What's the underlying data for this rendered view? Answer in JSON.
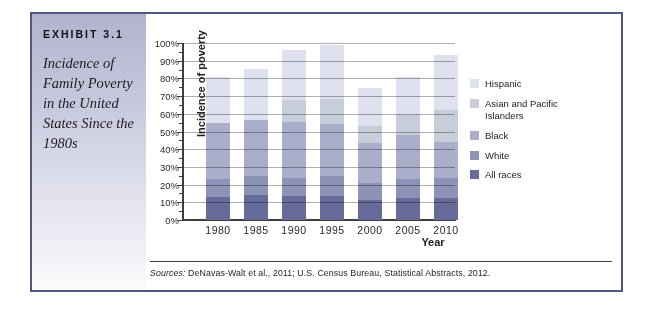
{
  "exhibit": {
    "label": "EXHIBIT 3.1",
    "title": "Incidence of Family Poverty in the United States Since the 1980s"
  },
  "chart_data": {
    "type": "bar",
    "stacked": true,
    "xlabel": "Year",
    "ylabel": "Incidence of poverty",
    "ylim": [
      0,
      100
    ],
    "ytick_step": 10,
    "ytick_minor_step": 5,
    "ytick_suffix": "%",
    "grid": true,
    "legend_position": "right",
    "legend_order": "top-of-stack-first",
    "categories": [
      "1980",
      "1985",
      "1990",
      "1995",
      "2000",
      "2005",
      "2010"
    ],
    "series": [
      {
        "name": "All races",
        "color": "#666b99",
        "values": [
          13.0,
          14.0,
          13.5,
          13.8,
          11.3,
          12.6,
          12.5
        ]
      },
      {
        "name": "White",
        "color": "#8d92b7",
        "values": [
          10.0,
          11.0,
          10.5,
          11.2,
          9.5,
          10.6,
          11.5
        ]
      },
      {
        "name": "Black",
        "color": "#aaaeca",
        "values": [
          32.0,
          31.5,
          31.5,
          29.0,
          22.5,
          24.9,
          20.0
        ]
      },
      {
        "name": "Asian and Pacific Islanders",
        "color": "#c8ced9",
        "values": [
          0,
          0,
          12.5,
          14.5,
          10.0,
          11.1,
          18.0
        ]
      },
      {
        "name": "Hispanic",
        "color": "#dfe2ee",
        "values": [
          26.0,
          29.0,
          28.0,
          30.5,
          21.5,
          21.8,
          31.0
        ]
      }
    ],
    "stack_totals": [
      81.0,
      85.5,
      96.0,
      99.0,
      74.8,
      81.0,
      93.0
    ]
  },
  "source_note": {
    "prefix": "Sources:",
    "text": " DeNavas-Walt et al., 2011; U.S. Census Bureau, Statistical Abstracts, 2012."
  }
}
